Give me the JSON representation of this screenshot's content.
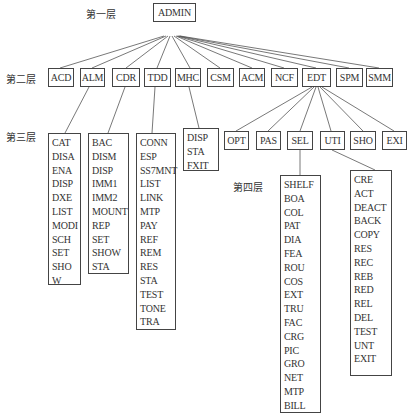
{
  "levels": {
    "l1": "第一层",
    "l2": "第二层",
    "l3": "第三层",
    "l4": "第四层"
  },
  "root": {
    "label": "ADMIN"
  },
  "level2": [
    {
      "label": "ACD"
    },
    {
      "label": "ALM"
    },
    {
      "label": "CDR"
    },
    {
      "label": "TDD"
    },
    {
      "label": "MHC"
    },
    {
      "label": "CSM"
    },
    {
      "label": "ACM"
    },
    {
      "label": "NCF"
    },
    {
      "label": "EDT"
    },
    {
      "label": "SPM"
    },
    {
      "label": "SMM"
    }
  ],
  "level3_edt": [
    {
      "label": "OPT"
    },
    {
      "label": "PAS"
    },
    {
      "label": "SEL"
    },
    {
      "label": "UTI"
    },
    {
      "label": "SHO"
    },
    {
      "label": "EXI"
    }
  ],
  "lists": {
    "alm": [
      "CAT",
      "DISA",
      "ENA",
      "DISP",
      "DXE",
      "LIST",
      "MODI",
      "SCH",
      "SET",
      "SHO",
      "W"
    ],
    "cdr": [
      "BAC",
      "DISM",
      "DISP",
      "IMM1",
      "IMM2",
      "MOUNT",
      "REP",
      "SET",
      "SHOW",
      "STA"
    ],
    "tdd": [
      "CONN",
      "ESP",
      "SS7MNT",
      "LIST",
      "LINK",
      "MTP",
      "PAY",
      "REF",
      "REM",
      "RES",
      "STA",
      "TEST",
      "TONE",
      "TRA"
    ],
    "mhc": [
      "DISP",
      "STA",
      "FXIT"
    ],
    "sel": [
      "SHELF",
      "BOA",
      "COL",
      "PAT",
      "DIA",
      "FEA",
      "ROU",
      "COS",
      "EXT",
      "TRU",
      "FAC",
      "CRG",
      "PIC",
      "GRO",
      "NET",
      "MTP",
      "BILL"
    ],
    "uti": [
      "CRE",
      "ACT",
      "DEACT",
      "BACK",
      "COPY",
      "RES",
      "REC",
      "REB",
      "RED",
      "REL",
      "DEL",
      "TEST",
      "UNT",
      "EXIT"
    ]
  }
}
